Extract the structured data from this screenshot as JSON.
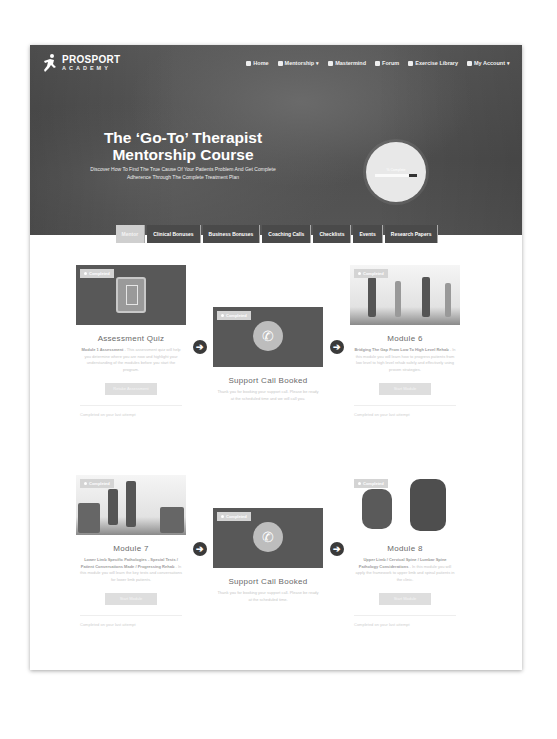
{
  "header": {
    "logo": {
      "top": "PROSPORT",
      "bottom": "ACADEMY",
      "icon": "runner-icon"
    },
    "nav": [
      {
        "label": "Home",
        "icon": "home-icon",
        "caret": false
      },
      {
        "label": "Mentorship",
        "icon": "graduation-icon",
        "caret": true
      },
      {
        "label": "Mastermind",
        "icon": "trophy-icon",
        "caret": false
      },
      {
        "label": "Forum",
        "icon": "chat-icon",
        "caret": false
      },
      {
        "label": "Exercise Library",
        "icon": "dumbbell-icon",
        "caret": false
      },
      {
        "label": "My Account",
        "icon": "user-icon",
        "caret": true
      }
    ]
  },
  "hero": {
    "title_line1": "The ‘Go-To’ Therapist",
    "title_line2": "Mentorship Course",
    "subtitle": "Discover How To Find The True Cause Of Your Patients Problem And Get Complete Adherence Through The Complete Treatment Plan",
    "progress": {
      "label": "% Complete",
      "percent": 80
    }
  },
  "tabs": [
    {
      "label": "Mentor",
      "active": true
    },
    {
      "label": "Clinical Bonuses",
      "active": false
    },
    {
      "label": "Business Bonuses",
      "active": false
    },
    {
      "label": "Coaching Calls",
      "active": false
    },
    {
      "label": "Checklists",
      "active": false
    },
    {
      "label": "Events",
      "active": false
    },
    {
      "label": "Research Papers",
      "active": false
    }
  ],
  "cards": [
    {
      "badge": "Completed",
      "title": "Assessment Quiz",
      "lead": "Module 1 Assessment",
      "body": "- This assessment quiz will help you determine where you are now and highlight your understanding of the modules before you start the program.",
      "button": "Retake Assessment",
      "meta": "Completed on your last attempt"
    },
    {
      "badge": "Completed",
      "title": "Support Call Booked",
      "lead": "",
      "body": "Thank you for booking your support call. Please be ready at the scheduled time and we will call you.",
      "button": "",
      "meta": ""
    },
    {
      "badge": "Completed",
      "title": "Module 6",
      "lead": "Bridging The Gap From Low To High Level Rehab",
      "body": "- In this module you will learn how to progress patients from low level to high level rehab safely and effectively using proven strategies.",
      "button": "Start Module",
      "meta": "Completed on your last attempt"
    },
    {
      "badge": "Completed",
      "title": "Module 7",
      "lead": "Lower Limb Specific Pathologies - Special Tests / Patient Conversations Made / Progressing Rehab",
      "body": "- In this module you will learn the key tests and conversations for lower limb patients.",
      "button": "Start Module",
      "meta": "Completed on your last attempt"
    },
    {
      "badge": "Completed",
      "title": "Support Call Booked",
      "lead": "",
      "body": "Thank you for booking your support call. Please be ready at the scheduled time.",
      "button": "",
      "meta": ""
    },
    {
      "badge": "Completed",
      "title": "Module 8",
      "lead": "Upper Limb / Cervical Spine / Lumbar Spine Pathology Considerations",
      "body": "- In this module you will apply the framework to upper limb and spinal patients in the clinic.",
      "button": "Start Module",
      "meta": "Completed on your last attempt"
    }
  ],
  "arrows": [
    "arrow-right",
    "arrow-right",
    "arrow-right",
    "arrow-right"
  ]
}
